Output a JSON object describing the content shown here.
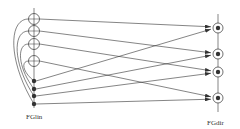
{
  "diagram": {
    "type": "network-diagram",
    "left_group": {
      "label": "FGlin",
      "open_nodes": [
        {
          "id": "c1",
          "x": 34,
          "y": 19
        },
        {
          "id": "c2",
          "x": 34,
          "y": 31
        },
        {
          "id": "c3",
          "x": 34,
          "y": 44
        },
        {
          "id": "c4",
          "x": 34,
          "y": 61
        }
      ],
      "filled_nodes": [
        {
          "id": "d1",
          "x": 34,
          "y": 81
        },
        {
          "id": "d2",
          "x": 34,
          "y": 89
        },
        {
          "id": "d3",
          "x": 34,
          "y": 96
        },
        {
          "id": "d4",
          "x": 34,
          "y": 104
        }
      ]
    },
    "right_group": {
      "label": "FGdir",
      "nodes": [
        {
          "id": "r1",
          "x": 218,
          "y": 28
        },
        {
          "id": "r2",
          "x": 218,
          "y": 54
        },
        {
          "id": "r3",
          "x": 218,
          "y": 72
        },
        {
          "id": "r4",
          "x": 218,
          "y": 98
        }
      ]
    },
    "arrows": [
      {
        "from": "c1",
        "to": "r1"
      },
      {
        "from": "c2",
        "to": "r2"
      },
      {
        "from": "c3",
        "to": "r3"
      },
      {
        "from": "c4",
        "to": "r4"
      },
      {
        "from": "d1",
        "to": "r1"
      },
      {
        "from": "d2",
        "to": "r2"
      },
      {
        "from": "d3",
        "to": "r3"
      },
      {
        "from": "d4",
        "to": "r4"
      }
    ],
    "curves": [
      {
        "from": "c1",
        "to": "d4"
      },
      {
        "from": "c2",
        "to": "d3"
      },
      {
        "from": "c3",
        "to": "d2"
      },
      {
        "from": "c4",
        "to": "d1"
      }
    ],
    "colors": {
      "line": "#333333",
      "background": "#ffffff"
    }
  }
}
